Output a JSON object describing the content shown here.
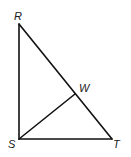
{
  "diagram": {
    "type": "geometry-figure",
    "stroke_color": "#111111",
    "label_color": "#1a1a1a",
    "points": {
      "R": {
        "label": "R",
        "x": 19,
        "y": 24
      },
      "S": {
        "label": "S",
        "x": 19,
        "y": 139
      },
      "T": {
        "label": "T",
        "x": 112,
        "y": 139
      },
      "W": {
        "label": "W",
        "x": 75,
        "y": 94
      }
    },
    "segments": [
      {
        "name": "RS",
        "from": "R",
        "to": "S"
      },
      {
        "name": "ST",
        "from": "S",
        "to": "T"
      },
      {
        "name": "RT",
        "from": "R",
        "to": "T"
      },
      {
        "name": "SW",
        "from": "S",
        "to": "W"
      }
    ],
    "labels": {
      "R": "R",
      "S": "S",
      "T": "T",
      "W": "W"
    }
  }
}
